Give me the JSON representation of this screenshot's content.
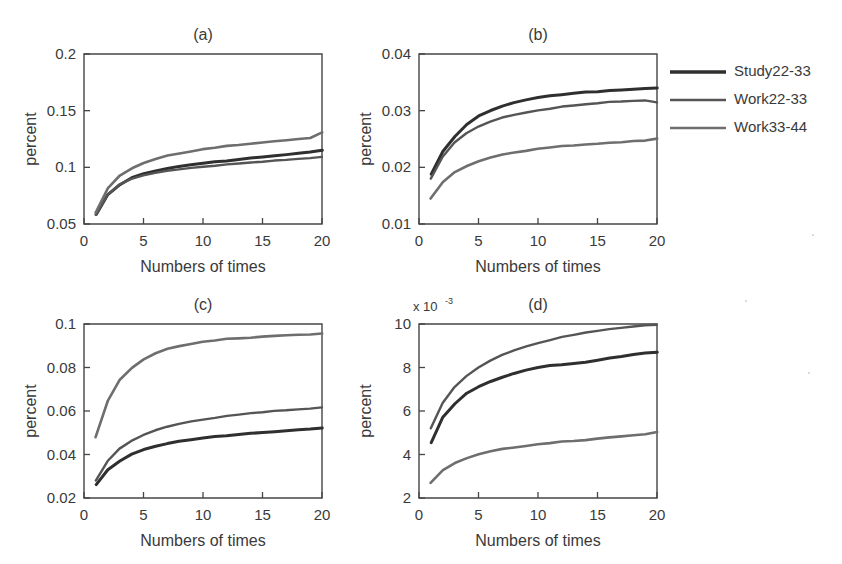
{
  "figure": {
    "background": "#ffffff",
    "ink_color": "#3a3a3a"
  },
  "legend": {
    "position": "right",
    "border": false,
    "entries": [
      {
        "label": "Study22-33",
        "color": "#2f2f2f",
        "width": 3.4
      },
      {
        "label": "Work22-33",
        "color": "#555555",
        "width": 2.4
      },
      {
        "label": "Work33-44",
        "color": "#6e6e6e",
        "width": 2.6
      }
    ]
  },
  "chart_data": [
    {
      "id": "a",
      "type": "line",
      "title": "(a)",
      "xlabel": "Numbers of times",
      "ylabel": "percent",
      "xlim": [
        0,
        20
      ],
      "ylim": [
        0.05,
        0.2
      ],
      "xticks": [
        0,
        5,
        10,
        15,
        20
      ],
      "xticklabels": [
        "0",
        "5",
        "10",
        "15",
        "20"
      ],
      "yticks": [
        0.05,
        0.1,
        0.15,
        0.2
      ],
      "yticklabels": [
        "0.05",
        "0.1",
        "0.15",
        "0.2"
      ],
      "grid": false,
      "exponent": "",
      "x": [
        1,
        2,
        3,
        4,
        5,
        6,
        7,
        8,
        9,
        10,
        11,
        12,
        13,
        14,
        15,
        16,
        17,
        18,
        19,
        20
      ],
      "series": [
        {
          "name": "Study22-33",
          "color": "#2f2f2f",
          "width": 3.0,
          "values": [
            0.0585,
            0.076,
            0.085,
            0.0905,
            0.094,
            0.0967,
            0.099,
            0.1007,
            0.1022,
            0.1035,
            0.1048,
            0.106,
            0.1072,
            0.1083,
            0.1094,
            0.1104,
            0.1114,
            0.1124,
            0.1134,
            0.115
          ]
        },
        {
          "name": "Work22-33",
          "color": "#555555",
          "width": 2.4,
          "values": [
            0.058,
            0.0755,
            0.0845,
            0.0898,
            0.093,
            0.0952,
            0.097,
            0.0985,
            0.0997,
            0.1008,
            0.1017,
            0.1025,
            0.1033,
            0.1041,
            0.1049,
            0.1057,
            0.1065,
            0.1073,
            0.1081,
            0.1095
          ]
        },
        {
          "name": "Work33-44",
          "color": "#6e6e6e",
          "width": 2.6,
          "values": [
            0.06,
            0.082,
            0.093,
            0.0995,
            0.104,
            0.1073,
            0.11,
            0.1122,
            0.114,
            0.1157,
            0.1172,
            0.1186,
            0.1199,
            0.1211,
            0.1222,
            0.1233,
            0.1243,
            0.1253,
            0.1263,
            0.1305
          ]
        }
      ]
    },
    {
      "id": "b",
      "type": "line",
      "title": "(b)",
      "xlabel": "Numbers of times",
      "ylabel": "percent",
      "xlim": [
        0,
        20
      ],
      "ylim": [
        0.01,
        0.04
      ],
      "xticks": [
        0,
        5,
        10,
        15,
        20
      ],
      "xticklabels": [
        "0",
        "5",
        "10",
        "15",
        "20"
      ],
      "yticks": [
        0.01,
        0.02,
        0.03,
        0.04
      ],
      "yticklabels": [
        "0.01",
        "0.02",
        "0.03",
        "0.04"
      ],
      "grid": false,
      "exponent": "",
      "x": [
        1,
        2,
        3,
        4,
        5,
        6,
        7,
        8,
        9,
        10,
        11,
        12,
        13,
        14,
        15,
        16,
        17,
        18,
        19,
        20
      ],
      "series": [
        {
          "name": "Study22-33",
          "color": "#2f2f2f",
          "width": 3.0,
          "values": [
            0.0188,
            0.0228,
            0.0255,
            0.0275,
            0.029,
            0.03,
            0.0308,
            0.0314,
            0.0319,
            0.0323,
            0.0326,
            0.0329,
            0.0331,
            0.0333,
            0.0334,
            0.0336,
            0.0337,
            0.0338,
            0.0339,
            0.034
          ]
        },
        {
          "name": "Work22-33",
          "color": "#555555",
          "width": 2.4,
          "values": [
            0.018,
            0.0218,
            0.0243,
            0.026,
            0.0272,
            0.0281,
            0.0288,
            0.0293,
            0.0297,
            0.0301,
            0.0304,
            0.0307,
            0.0309,
            0.0311,
            0.0313,
            0.0315,
            0.0316,
            0.0317,
            0.0318,
            0.0315
          ]
        },
        {
          "name": "Work33-44",
          "color": "#6e6e6e",
          "width": 2.6,
          "values": [
            0.0145,
            0.0175,
            0.0192,
            0.0203,
            0.0211,
            0.0217,
            0.0222,
            0.0226,
            0.0229,
            0.0232,
            0.0235,
            0.0237,
            0.0239,
            0.0241,
            0.0242,
            0.0244,
            0.0245,
            0.0247,
            0.0248,
            0.025
          ]
        }
      ]
    },
    {
      "id": "c",
      "type": "line",
      "title": "(c)",
      "xlabel": "Numbers of times",
      "ylabel": "percent",
      "xlim": [
        0,
        20
      ],
      "ylim": [
        0.02,
        0.1
      ],
      "xticks": [
        0,
        5,
        10,
        15,
        20
      ],
      "xticklabels": [
        "0",
        "5",
        "10",
        "15",
        "20"
      ],
      "yticks": [
        0.02,
        0.04,
        0.06,
        0.08,
        0.1
      ],
      "yticklabels": [
        "0.02",
        "0.04",
        "0.06",
        "0.08",
        "0.1"
      ],
      "grid": false,
      "exponent": "",
      "x": [
        1,
        2,
        3,
        4,
        5,
        6,
        7,
        8,
        9,
        10,
        11,
        12,
        13,
        14,
        15,
        16,
        17,
        18,
        19,
        20
      ],
      "series": [
        {
          "name": "Study22-33",
          "color": "#2f2f2f",
          "width": 3.0,
          "values": [
            0.0262,
            0.033,
            0.0372,
            0.04,
            0.0421,
            0.0437,
            0.045,
            0.046,
            0.0468,
            0.0476,
            0.0482,
            0.0488,
            0.0493,
            0.0498,
            0.0502,
            0.0506,
            0.051,
            0.0514,
            0.0517,
            0.0522
          ]
        },
        {
          "name": "Work22-33",
          "color": "#555555",
          "width": 2.4,
          "values": [
            0.028,
            0.0368,
            0.0425,
            0.0462,
            0.049,
            0.0512,
            0.0528,
            0.0542,
            0.0553,
            0.0562,
            0.057,
            0.0577,
            0.0583,
            0.0589,
            0.0594,
            0.0599,
            0.0603,
            0.0607,
            0.0611,
            0.0618
          ]
        },
        {
          "name": "Work33-44",
          "color": "#6e6e6e",
          "width": 2.6,
          "values": [
            0.048,
            0.065,
            0.0745,
            0.08,
            0.0838,
            0.0865,
            0.0884,
            0.0898,
            0.0908,
            0.0917,
            0.0924,
            0.093,
            0.0935,
            0.0939,
            0.0943,
            0.0947,
            0.095,
            0.0952,
            0.0954,
            0.0955
          ]
        }
      ]
    },
    {
      "id": "d",
      "type": "line",
      "title": "(d)",
      "xlabel": "Numbers of times",
      "ylabel": "percent",
      "xlim": [
        0,
        20
      ],
      "ylim": [
        2,
        10
      ],
      "xticks": [
        0,
        5,
        10,
        15,
        20
      ],
      "xticklabels": [
        "0",
        "5",
        "10",
        "15",
        "20"
      ],
      "yticks": [
        2,
        4,
        6,
        8,
        10
      ],
      "yticklabels": [
        "2",
        "4",
        "6",
        "8",
        "10"
      ],
      "grid": false,
      "exponent": "x 10",
      "exponent_sup": "-3",
      "x": [
        1,
        2,
        3,
        4,
        5,
        6,
        7,
        8,
        9,
        10,
        11,
        12,
        13,
        14,
        15,
        16,
        17,
        18,
        19,
        20
      ],
      "series": [
        {
          "name": "Study22-33",
          "color": "#2f2f2f",
          "width": 3.0,
          "values": [
            4.55,
            5.72,
            6.35,
            6.8,
            7.1,
            7.35,
            7.55,
            7.72,
            7.88,
            8.0,
            8.08,
            8.15,
            8.2,
            8.25,
            8.35,
            8.45,
            8.52,
            8.6,
            8.66,
            8.7
          ]
        },
        {
          "name": "Work22-33",
          "color": "#555555",
          "width": 2.4,
          "values": [
            5.2,
            6.35,
            7.08,
            7.6,
            8.0,
            8.32,
            8.58,
            8.8,
            8.98,
            9.14,
            9.28,
            9.4,
            9.5,
            9.6,
            9.68,
            9.75,
            9.82,
            9.88,
            9.94,
            9.98
          ]
        },
        {
          "name": "Work33-44",
          "color": "#6e6e6e",
          "width": 2.6,
          "values": [
            2.7,
            3.3,
            3.62,
            3.85,
            4.02,
            4.14,
            4.24,
            4.32,
            4.39,
            4.45,
            4.52,
            4.58,
            4.63,
            4.68,
            4.74,
            4.8,
            4.85,
            4.9,
            4.95,
            5.02
          ]
        }
      ]
    }
  ]
}
